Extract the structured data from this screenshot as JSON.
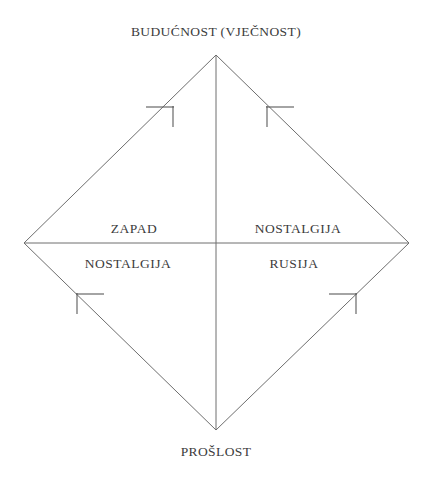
{
  "diagram": {
    "background_color": "#ffffff",
    "line_color": "#6e6e6e",
    "text_color": "#3c3c3c",
    "axes": {
      "vertical": {
        "top_label": "BUDUĆNOST (VJEČNOST)",
        "bottom_label": "PROŠLOST"
      }
    },
    "quadrants": [
      {
        "position": "top-left",
        "label": "ZAPAD"
      },
      {
        "position": "top-right",
        "label": "NOSTALGIJA"
      },
      {
        "position": "bottom-left",
        "label": "NOSTALGIJA"
      },
      {
        "position": "bottom-right",
        "label": "RUSIJA"
      }
    ],
    "vertices": {
      "top": {
        "x": 216,
        "y": 55
      },
      "right": {
        "x": 409,
        "y": 243
      },
      "bottom": {
        "x": 216,
        "y": 430
      },
      "left": {
        "x": 24,
        "y": 243
      }
    },
    "edge_markers": [
      {
        "edge": "top-left",
        "direction": "toward-top-vertex"
      },
      {
        "edge": "top-right",
        "direction": "toward-top-vertex"
      },
      {
        "edge": "bottom-left",
        "direction": "toward-left-vertex"
      },
      {
        "edge": "bottom-right",
        "direction": "toward-right-vertex"
      }
    ]
  }
}
